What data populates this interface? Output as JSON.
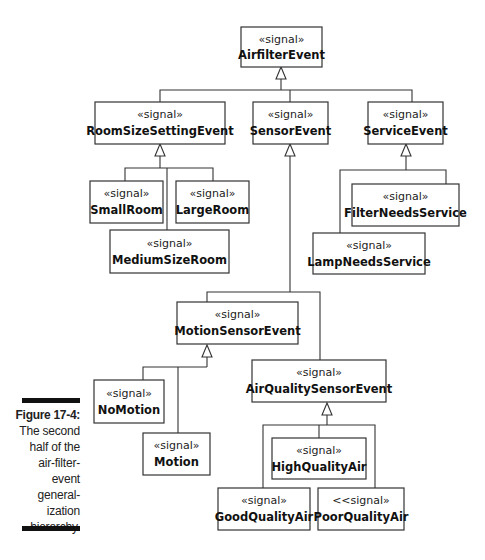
{
  "caption": {
    "title": "Figure 17-4:",
    "lines": [
      "The second",
      "half of the",
      "air-filter-",
      "event",
      "general-",
      "ization",
      "hierarchy."
    ]
  },
  "classes": {
    "airfilter_event": {
      "stereotype": "«signal»",
      "name": "AirfilterEvent"
    },
    "room_size_setting_event": {
      "stereotype": "«signal»",
      "name": "RoomSizeSettingEvent"
    },
    "sensor_event": {
      "stereotype": "«signal»",
      "name": "SensorEvent"
    },
    "service_event": {
      "stereotype": "«signal»",
      "name": "ServiceEvent"
    },
    "small_room": {
      "stereotype": "«signal»",
      "name": "SmallRoom"
    },
    "large_room": {
      "stereotype": "«signal»",
      "name": "LargeRoom"
    },
    "medium_size_room": {
      "stereotype": "«signal»",
      "name": "MediumSizeRoom"
    },
    "filter_needs_service": {
      "stereotype": "«signal»",
      "name": "FilterNeedsService"
    },
    "lamp_needs_service": {
      "stereotype": "«signal»",
      "name": "LampNeedsService"
    },
    "motion_sensor_event": {
      "stereotype": "«signal»",
      "name": "MotionSensorEvent"
    },
    "air_quality_sensor_event": {
      "stereotype": "«signal»",
      "name": "AirQualitySensorEvent"
    },
    "no_motion": {
      "stereotype": "«signal»",
      "name": "NoMotion"
    },
    "motion": {
      "stereotype": "«signal»",
      "name": "Motion"
    },
    "high_quality_air": {
      "stereotype": "«signal»",
      "name": "HighQualityAir"
    },
    "good_quality_air": {
      "stereotype": "«signal»",
      "name": "GoodQualityAir"
    },
    "poor_quality_air": {
      "stereotype": "<<signal»",
      "name": "PoorQualityAir"
    }
  },
  "generalizations": [
    {
      "parent": "AirfilterEvent",
      "children": [
        "RoomSizeSettingEvent",
        "SensorEvent",
        "ServiceEvent"
      ]
    },
    {
      "parent": "RoomSizeSettingEvent",
      "children": [
        "SmallRoom",
        "LargeRoom",
        "MediumSizeRoom"
      ]
    },
    {
      "parent": "ServiceEvent",
      "children": [
        "FilterNeedsService",
        "LampNeedsService"
      ]
    },
    {
      "parent": "SensorEvent",
      "children": [
        "MotionSensorEvent",
        "AirQualitySensorEvent"
      ]
    },
    {
      "parent": "MotionSensorEvent",
      "children": [
        "NoMotion",
        "Motion"
      ]
    },
    {
      "parent": "AirQualitySensorEvent",
      "children": [
        "HighQualityAir",
        "GoodQualityAir",
        "PoorQualityAir"
      ]
    }
  ]
}
